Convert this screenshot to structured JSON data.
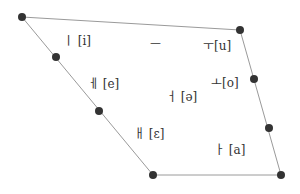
{
  "diagram": {
    "type": "vowel-chart",
    "colors": {
      "line": "#9a9a9a",
      "dot": "#333333",
      "text": "#333333"
    },
    "polygon": [
      [
        22,
        17
      ],
      [
        240,
        30
      ],
      [
        281,
        175
      ],
      [
        153,
        175
      ]
    ],
    "dots": [
      {
        "name": "corner-top-left",
        "x": 22,
        "y": 17
      },
      {
        "name": "corner-top-right",
        "x": 240,
        "y": 30
      },
      {
        "name": "right-upper-mid",
        "x": 254,
        "y": 79
      },
      {
        "name": "right-lower-mid",
        "x": 269,
        "y": 128
      },
      {
        "name": "corner-bottom-right",
        "x": 281,
        "y": 175
      },
      {
        "name": "corner-bottom-left",
        "x": 153,
        "y": 175
      },
      {
        "name": "left-upper-mid",
        "x": 56,
        "y": 57
      },
      {
        "name": "left-lower-mid",
        "x": 99,
        "y": 111
      }
    ],
    "labels": [
      {
        "id": "i",
        "hangul": "ㅣ",
        "ipa": "[i]",
        "x": 63,
        "y": 35
      },
      {
        "id": "eu",
        "hangul": "ㅡ",
        "ipa": "",
        "x": 150,
        "y": 39
      },
      {
        "id": "u",
        "hangul": "ㅜ",
        "ipa": "[u]",
        "x": 205,
        "y": 40
      },
      {
        "id": "e",
        "hangul": "ㅔ",
        "ipa": "[e]",
        "x": 90,
        "y": 78
      },
      {
        "id": "eo",
        "hangul": "ㅓ",
        "ipa": "[ə]",
        "x": 165,
        "y": 91
      },
      {
        "id": "o",
        "hangul": "ㅗ",
        "ipa": "[o]",
        "x": 212,
        "y": 77
      },
      {
        "id": "ae",
        "hangul": "ㅐ",
        "ipa": "[ɛ]",
        "x": 136,
        "y": 128
      },
      {
        "id": "a",
        "hangul": "ㅏ",
        "ipa": "[a]",
        "x": 215,
        "y": 143
      }
    ]
  }
}
